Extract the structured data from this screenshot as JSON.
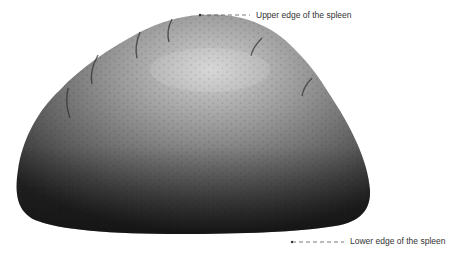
{
  "diagram": {
    "labels": {
      "upper": "Upper edge of the spleen",
      "lower": "Lower edge of the spleen"
    },
    "colors": {
      "organ_dark": "#2a2a2a",
      "organ_mid": "#6b6b6b",
      "organ_light": "#c8c8c8",
      "leader_line": "#555555",
      "label_text": "#333333"
    }
  }
}
